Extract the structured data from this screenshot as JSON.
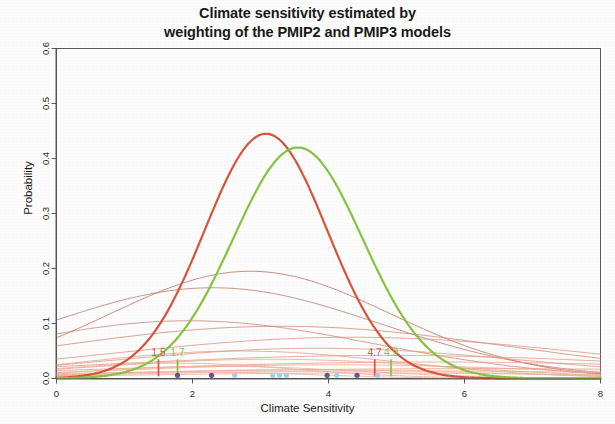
{
  "chart_data": {
    "type": "line",
    "title": "Climate sensitivity estimated by weighting of the PMIP2 and PMIP3 models",
    "title_lines": [
      "Climate sensitivity estimated by",
      "weighting of the PMIP2 and PMIP3 models"
    ],
    "xlabel": "Climate Sensitivity",
    "ylabel": "Probability",
    "xlim": [
      0,
      8
    ],
    "ylim": [
      0,
      0.6
    ],
    "xticks": [
      0,
      2,
      4,
      6,
      8
    ],
    "xtick_labels": [
      "0",
      "2",
      "4",
      "6",
      "8"
    ],
    "yticks": [
      0.0,
      0.1,
      0.2,
      0.3,
      0.4,
      0.5,
      0.6
    ],
    "ytick_labels": [
      "0.0",
      "0.1",
      "0.2",
      "0.3",
      "0.4",
      "0.5",
      "0.6"
    ],
    "grid": false,
    "legend": "none",
    "colors": {
      "weighted_pdf": "#d9543c",
      "unweighted_pdf": "#86c440",
      "individual_pdf": "#e8836b",
      "individual_pdf_dark": "#b5685e",
      "rug_pmip2": "#5b4e8c",
      "rug_pmip3": "#9fd0e8",
      "axis": "#4a4a4a",
      "text": "#1a1a1a"
    },
    "series": [
      {
        "name": "weighted PDF (PMIP2+PMIP3)",
        "color": "#d9543c",
        "width": 2.2,
        "kind": "gaussian",
        "mean": 3.08,
        "sd": 0.9,
        "peak": 0.445
      },
      {
        "name": "unweighted PDF",
        "color": "#86c440",
        "width": 2.2,
        "kind": "gaussian",
        "mean": 3.55,
        "sd": 0.95,
        "peak": 0.42
      }
    ],
    "individual_model_pdfs": [
      {
        "mean": 2.85,
        "sd": 2.05,
        "peak": 0.195,
        "color": "#c06f62",
        "width": 0.9
      },
      {
        "mean": 2.3,
        "sd": 2.45,
        "peak": 0.165,
        "color": "#c07a6e",
        "width": 0.9
      },
      {
        "mean": 1.95,
        "sd": 2.7,
        "peak": 0.105,
        "color": "#cc8878",
        "width": 0.9
      },
      {
        "mean": 3.3,
        "sd": 3.4,
        "peak": 0.095,
        "color": "#d08a78",
        "width": 0.9
      },
      {
        "mean": 4.35,
        "sd": 3.55,
        "peak": 0.075,
        "color": "#de9481",
        "width": 0.9
      },
      {
        "mean": 3.85,
        "sd": 3.0,
        "peak": 0.055,
        "color": "#e09a85",
        "width": 0.9
      },
      {
        "mean": 2.7,
        "sd": 2.3,
        "peak": 0.05,
        "color": "#e2a08c",
        "width": 0.9
      },
      {
        "mean": 4.85,
        "sd": 4.2,
        "peak": 0.042,
        "color": "#e79a83",
        "width": 0.9
      },
      {
        "mean": 3.15,
        "sd": 2.6,
        "peak": 0.035,
        "color": "#e9a791",
        "width": 0.9
      },
      {
        "mean": 5.55,
        "sd": 4.6,
        "peak": 0.03,
        "color": "#eb9d86",
        "width": 0.9
      },
      {
        "mean": 1.7,
        "sd": 1.8,
        "peak": 0.028,
        "color": "#eaa894",
        "width": 0.9
      },
      {
        "mean": 4.1,
        "sd": 3.2,
        "peak": 0.025,
        "color": "#eba892",
        "width": 0.9
      },
      {
        "mean": 2.45,
        "sd": 2.0,
        "peak": 0.022,
        "color": "#eeae9b",
        "width": 0.9
      },
      {
        "mean": 6.2,
        "sd": 5.2,
        "peak": 0.018,
        "color": "#ec9e8a",
        "width": 0.9
      },
      {
        "mean": 3.6,
        "sd": 2.8,
        "peak": 0.016,
        "color": "#f0b19e",
        "width": 0.9
      },
      {
        "mean": 5.1,
        "sd": 4.0,
        "peak": 0.014,
        "color": "#eea793",
        "width": 0.9
      },
      {
        "mean": 2.1,
        "sd": 1.6,
        "peak": 0.012,
        "color": "#f0b4a1",
        "width": 0.9
      },
      {
        "mean": 4.6,
        "sd": 3.6,
        "peak": 0.01,
        "color": "#efab97",
        "width": 0.9
      }
    ],
    "confidence_markers": [
      {
        "label": "1.5",
        "x": 1.5,
        "color": "#d9543c",
        "height": 0.035,
        "series": "weighted PDF"
      },
      {
        "label": "1.7",
        "x": 1.78,
        "color": "#86c440",
        "height": 0.035,
        "series": "unweighted PDF"
      },
      {
        "label": "4.7",
        "x": 4.68,
        "color": "#d9543c",
        "height": 0.035,
        "series": "weighted PDF"
      },
      {
        "label": "4.9",
        "x": 4.92,
        "color": "#86c440",
        "height": 0.035,
        "series": "unweighted PDF"
      }
    ],
    "rug_points": [
      {
        "x": 1.78,
        "color": "#5b4e8c"
      },
      {
        "x": 2.28,
        "color": "#5b4e8c"
      },
      {
        "x": 2.62,
        "color": "#9fd0e8"
      },
      {
        "x": 3.18,
        "color": "#9fd0e8"
      },
      {
        "x": 3.28,
        "color": "#9fd0e8"
      },
      {
        "x": 3.38,
        "color": "#9fd0e8"
      },
      {
        "x": 3.98,
        "color": "#5b4e8c"
      },
      {
        "x": 4.12,
        "color": "#9fd0e8"
      },
      {
        "x": 4.42,
        "color": "#5b4e8c"
      },
      {
        "x": 4.72,
        "color": "#9fd0e8"
      }
    ]
  }
}
